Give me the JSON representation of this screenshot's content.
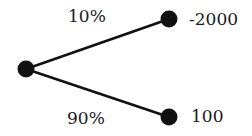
{
  "diagram": {
    "type": "probability-tree",
    "root": {
      "x": 26,
      "y": 69
    },
    "branches": [
      {
        "probability": "10%",
        "outcome": "-2000",
        "node": {
          "x": 169,
          "y": 19
        }
      },
      {
        "probability": "90%",
        "outcome": "100",
        "node": {
          "x": 169,
          "y": 117
        }
      }
    ],
    "colors": {
      "line": "#111111",
      "node": "#111111",
      "background": "#ffffff"
    }
  }
}
